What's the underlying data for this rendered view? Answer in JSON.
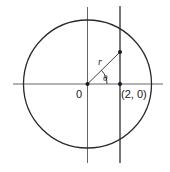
{
  "diagram": {
    "type": "polar-geometry",
    "labels": {
      "origin": "0",
      "point": "(2, 0)",
      "radius": "r",
      "angle": "θ"
    },
    "colors": {
      "stroke": "#2a2a2a",
      "axis": "#555555",
      "background": "#ffffff"
    }
  }
}
